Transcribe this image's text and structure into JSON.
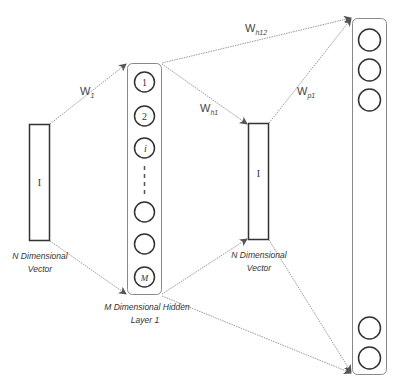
{
  "colors": {
    "stroke": "#333333",
    "connector": "#999999",
    "box_border": "#888888",
    "text": "#333333",
    "background": "#ffffff"
  },
  "input_vector": {
    "symbol": "I",
    "caption_line1": "N Dimensional",
    "caption_line2": "Vector"
  },
  "hidden_layer": {
    "nodes": [
      "1",
      "2",
      "i",
      "",
      "",
      "M"
    ],
    "caption_line1": "M Dimensional Hidden",
    "caption_line2": "Layer 1"
  },
  "output_vector": {
    "symbol": "I",
    "caption_line1": "N Dimensional",
    "caption_line2": "Vector"
  },
  "output_layer": {
    "node_count_visible": 5
  },
  "weights": {
    "w1": {
      "base": "W",
      "sub": "1"
    },
    "wh1": {
      "base": "W",
      "sub": "h1"
    },
    "wh12": {
      "base": "W",
      "sub": "h12"
    },
    "wp1": {
      "base": "W",
      "sub": "p1"
    }
  }
}
